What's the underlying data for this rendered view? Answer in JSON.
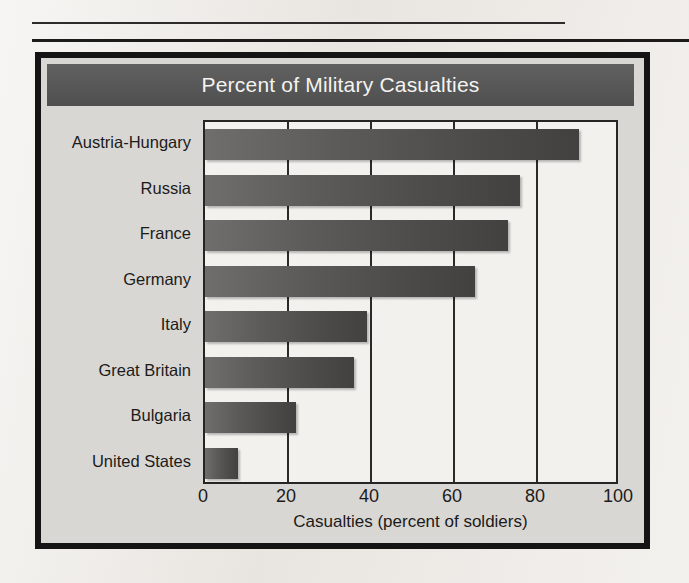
{
  "figure": {
    "title": "Percent of Military Casualties",
    "title_bar_color": "#585858",
    "title_text_color": "#f4f3f1",
    "panel_border_color": "#141414",
    "panel_background": "#d9d7d3",
    "plot_background": "#f2f1ee",
    "bar_color": "#55534f"
  },
  "chart_data": {
    "type": "bar",
    "orientation": "horizontal",
    "title": "Percent of Military Casualties",
    "xlabel": "Casualties (percent of soldiers)",
    "ylabel": "",
    "xlim": [
      0,
      100
    ],
    "xticks": [
      0,
      20,
      40,
      60,
      80,
      100
    ],
    "grid": true,
    "grid_axis": "x",
    "legend": false,
    "categories": [
      "Austria-Hungary",
      "Russia",
      "France",
      "Germany",
      "Italy",
      "Great Britain",
      "Bulgaria",
      "United States"
    ],
    "values": [
      90,
      76,
      73,
      65,
      39,
      36,
      22,
      8
    ]
  }
}
